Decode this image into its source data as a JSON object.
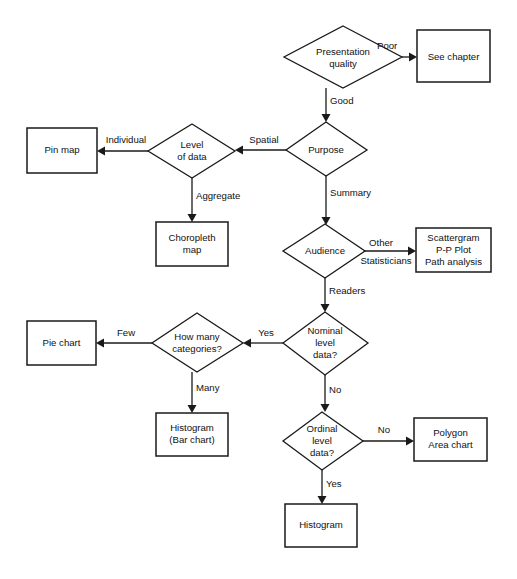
{
  "diagram": {
    "type": "flowchart",
    "background_color": "#ffffff",
    "line_color": "#1a1a1a",
    "text_color": "#111111"
  },
  "nodes": {
    "presentation_quality": {
      "shape": "decision",
      "line1": "Presentation",
      "line2": "quality"
    },
    "see_chapter": {
      "shape": "process",
      "line1": "See chapter"
    },
    "purpose": {
      "shape": "decision",
      "line1": "Purpose"
    },
    "level_of_data": {
      "shape": "decision",
      "line1": "Level",
      "line2": "of data"
    },
    "pin_map": {
      "shape": "process",
      "line1": "Pin map"
    },
    "choropleth_map": {
      "shape": "process",
      "line1": "Choropleth",
      "line2": "map"
    },
    "audience": {
      "shape": "decision",
      "line1": "Audience"
    },
    "scattergram": {
      "shape": "process",
      "line1": "Scattergram",
      "line2": "P-P Plot",
      "line3": "Path analysis"
    },
    "nominal_level_data": {
      "shape": "decision",
      "line1": "Nominal",
      "line2": "level",
      "line3": "data?"
    },
    "how_many_categories": {
      "shape": "decision",
      "line1": "How many",
      "line2": "categories?"
    },
    "pie_chart": {
      "shape": "process",
      "line1": "Pie chart"
    },
    "histogram_bar_chart": {
      "shape": "process",
      "line1": "Histogram",
      "line2": "(Bar chart)"
    },
    "ordinal_level_data": {
      "shape": "decision",
      "line1": "Ordinal",
      "line2": "level",
      "line3": "data?"
    },
    "polygon_area_chart": {
      "shape": "process",
      "line1": "Polygon",
      "line2": "Area chart"
    },
    "histogram": {
      "shape": "process",
      "line1": "Histogram"
    }
  },
  "edges": {
    "quality_poor": {
      "label": "Poor",
      "from": "presentation_quality",
      "to": "see_chapter"
    },
    "quality_good": {
      "label": "Good",
      "from": "presentation_quality",
      "to": "purpose"
    },
    "purpose_spatial": {
      "label": "Spatial",
      "from": "purpose",
      "to": "level_of_data"
    },
    "purpose_summary": {
      "label": "Summary",
      "from": "purpose",
      "to": "audience"
    },
    "level_individual": {
      "label": "Individual",
      "from": "level_of_data",
      "to": "pin_map"
    },
    "level_aggregate": {
      "label": "Aggregate",
      "from": "level_of_data",
      "to": "choropleth_map"
    },
    "audience_other": {
      "label": "Other",
      "from": "audience",
      "to": "scattergram"
    },
    "audience_statisticians": {
      "label": "Statisticians",
      "from": "audience",
      "to": "scattergram"
    },
    "audience_readers": {
      "label": "Readers",
      "from": "audience",
      "to": "nominal_level_data"
    },
    "nominal_yes": {
      "label": "Yes",
      "from": "nominal_level_data",
      "to": "how_many_categories"
    },
    "nominal_no": {
      "label": "No",
      "from": "nominal_level_data",
      "to": "ordinal_level_data"
    },
    "categories_few": {
      "label": "Few",
      "from": "how_many_categories",
      "to": "pie_chart"
    },
    "categories_many": {
      "label": "Many",
      "from": "how_many_categories",
      "to": "histogram_bar_chart"
    },
    "ordinal_no": {
      "label": "No",
      "from": "ordinal_level_data",
      "to": "polygon_area_chart"
    },
    "ordinal_yes": {
      "label": "Yes",
      "from": "ordinal_level_data",
      "to": "histogram"
    }
  }
}
